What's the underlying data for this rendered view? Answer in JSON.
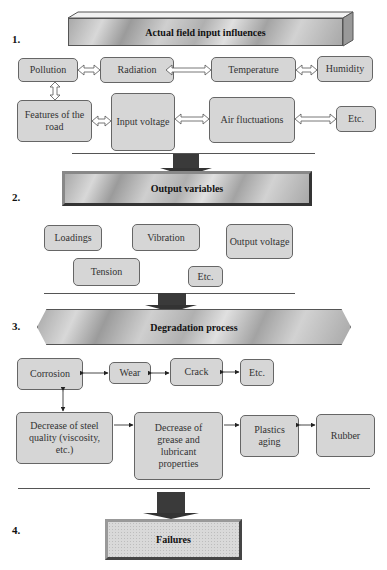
{
  "sections": [
    {
      "number": "1.",
      "title": "Actual field input influences",
      "row1": [
        "Pollution",
        "Radiation",
        "Temperature",
        "Humidity"
      ],
      "row2": [
        "Features of the road",
        "Input voltage",
        "Air fluctuations",
        "Etc."
      ]
    },
    {
      "number": "2.",
      "title": "Output variables",
      "items": [
        "Loadings",
        "Vibration",
        "Output voltage",
        "Tension",
        "Etc."
      ]
    },
    {
      "number": "3.",
      "title": "Degradation process",
      "row1": [
        "Corrosion",
        "Wear",
        "Crack",
        "Etc."
      ],
      "row2": [
        "Decrease of steel quality (viscosity, etc.)",
        "Decrease of grease and lubricant properties",
        "Plastics aging",
        "Rubber"
      ]
    },
    {
      "number": "4.",
      "title": "Failures"
    }
  ],
  "colors": {
    "box_fill": "#d6d6d6",
    "box_border": "#666666",
    "arrow": "#333333"
  }
}
